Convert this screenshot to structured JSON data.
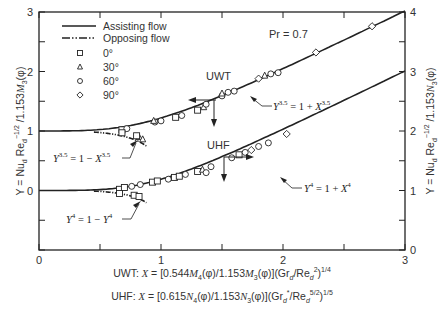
{
  "chart_data": {
    "type": "line",
    "title": "",
    "annotation_pr": "Pr = 0.7",
    "xlabel_lines": [
      "UWT: X = [0.544M4(φ)/1.153M3(φ)](Grd/Red²)^1/4",
      "UHF: X = [0.615N4(φ)/1.153N3(φ)](Gr*d/Red^5/2)^1/5"
    ],
    "ylabel_left": "Y = Nud Red^−1/2 / 1.153M3(φ)",
    "ylabel_right": "Y = Nud Red^−1/2 / 1.153N3(φ)",
    "xlim": [
      0,
      3
    ],
    "ylim_left": [
      -1,
      3
    ],
    "ylim_right": [
      0,
      4
    ],
    "x_ticks": [
      "0",
      "1",
      "2",
      "3"
    ],
    "y_ticks_left": [
      "0",
      "1",
      "2",
      "3"
    ],
    "y_ticks_right": [
      "0",
      "1",
      "2",
      "3",
      "4"
    ],
    "grid": false,
    "legend": {
      "position": "upper left",
      "lines": [
        {
          "label": "Assisting flow",
          "style": "solid"
        },
        {
          "label": "Opposing flow",
          "style": "dash-dot-dot"
        }
      ],
      "markers": [
        {
          "label": "0°",
          "marker": "square"
        },
        {
          "label": "30°",
          "marker": "triangle"
        },
        {
          "label": "60°",
          "marker": "circle"
        },
        {
          "label": "90°",
          "marker": "diamond"
        }
      ]
    },
    "series": [
      {
        "name": "UWT assisting",
        "axis": "left",
        "equation": "Y^3.5 = 1 + X^3.5",
        "n": 3.5,
        "sign": 1,
        "x_range": [
          0,
          3
        ]
      },
      {
        "name": "UWT opposing",
        "axis": "left",
        "equation": "Y^3.5 = 1 − X^3.5",
        "n": 3.5,
        "sign": -1,
        "x_range": [
          0.45,
          0.88
        ]
      },
      {
        "name": "UHF assisting",
        "axis": "right",
        "equation": "Y^4 = 1 + X^4",
        "n": 4,
        "sign": 1,
        "x_range": [
          0,
          3
        ]
      },
      {
        "name": "UHF opposing",
        "axis": "right",
        "equation": "Y^4 = 1 − Y^4",
        "n": 4,
        "sign": -1,
        "x_range": [
          0.45,
          0.88
        ]
      }
    ],
    "points": {
      "UWT": [
        {
          "m": "square",
          "x": 0.68,
          "y": 1.02
        },
        {
          "m": "circle",
          "x": 0.72,
          "y": 1.04
        },
        {
          "m": "square",
          "x": 0.68,
          "y": 0.97
        },
        {
          "m": "circle",
          "x": 0.95,
          "y": 1.15
        },
        {
          "m": "triangle",
          "x": 0.94,
          "y": 1.17
        },
        {
          "m": "circle",
          "x": 1.0,
          "y": 1.17
        },
        {
          "m": "square",
          "x": 1.12,
          "y": 1.23
        },
        {
          "m": "circle",
          "x": 1.17,
          "y": 1.26
        },
        {
          "m": "square",
          "x": 1.3,
          "y": 1.35
        },
        {
          "m": "triangle",
          "x": 1.35,
          "y": 1.4
        },
        {
          "m": "circle",
          "x": 1.37,
          "y": 1.45
        },
        {
          "m": "circle",
          "x": 1.5,
          "y": 1.59
        },
        {
          "m": "triangle",
          "x": 1.5,
          "y": 1.63
        },
        {
          "m": "circle",
          "x": 1.55,
          "y": 1.65
        },
        {
          "m": "circle",
          "x": 1.6,
          "y": 1.67
        },
        {
          "m": "diamond",
          "x": 1.8,
          "y": 1.88
        },
        {
          "m": "triangle",
          "x": 1.85,
          "y": 1.93
        },
        {
          "m": "circle",
          "x": 1.9,
          "y": 1.96
        },
        {
          "m": "circle",
          "x": 1.96,
          "y": 1.98
        },
        {
          "m": "diamond",
          "x": 2.27,
          "y": 2.32
        },
        {
          "m": "diamond",
          "x": 2.73,
          "y": 2.76
        },
        {
          "m": "triangle",
          "x": 0.82,
          "y": 0.9
        },
        {
          "m": "triangle",
          "x": 0.85,
          "y": 0.86
        },
        {
          "m": "square",
          "x": 0.8,
          "y": 0.92
        }
      ],
      "UHF": [
        {
          "m": "square",
          "x": 0.66,
          "y": 1.02
        },
        {
          "m": "square",
          "x": 0.7,
          "y": 1.05
        },
        {
          "m": "circle",
          "x": 0.76,
          "y": 1.07
        },
        {
          "m": "circle",
          "x": 0.83,
          "y": 1.1
        },
        {
          "m": "square",
          "x": 0.93,
          "y": 1.14
        },
        {
          "m": "square",
          "x": 0.97,
          "y": 1.16
        },
        {
          "m": "circle",
          "x": 1.06,
          "y": 1.19
        },
        {
          "m": "square",
          "x": 1.11,
          "y": 1.22
        },
        {
          "m": "square",
          "x": 1.15,
          "y": 1.24
        },
        {
          "m": "circle",
          "x": 1.2,
          "y": 1.27
        },
        {
          "m": "square",
          "x": 1.3,
          "y": 1.32
        },
        {
          "m": "triangle",
          "x": 1.34,
          "y": 1.35
        },
        {
          "m": "circle",
          "x": 1.37,
          "y": 1.3
        },
        {
          "m": "circle",
          "x": 1.41,
          "y": 1.4
        },
        {
          "m": "circle",
          "x": 1.58,
          "y": 1.55
        },
        {
          "m": "square",
          "x": 1.64,
          "y": 1.6
        },
        {
          "m": "circle",
          "x": 1.69,
          "y": 1.64
        },
        {
          "m": "diamond",
          "x": 1.74,
          "y": 1.68
        },
        {
          "m": "circle",
          "x": 1.8,
          "y": 1.74
        },
        {
          "m": "circle",
          "x": 1.88,
          "y": 1.8
        },
        {
          "m": "diamond",
          "x": 2.03,
          "y": 1.95
        },
        {
          "m": "square",
          "x": 0.66,
          "y": 0.95
        },
        {
          "m": "square",
          "x": 0.78,
          "y": 0.92
        },
        {
          "m": "square",
          "x": 0.82,
          "y": 0.9
        }
      ]
    },
    "curve_labels": {
      "uwt": "UWT",
      "uhf": "UHF",
      "uwt_assist": "Y^3.5 = 1 + X^3.5",
      "uwt_oppose": "Y^3.5 = 1 − X^3.5",
      "uhf_assist": "Y^4 = 1 + X^4",
      "uhf_oppose": "Y^4 = 1 − Y^4"
    }
  },
  "labels": {
    "pr": "Pr = 0.7",
    "uwt": "UWT",
    "uhf": "UHF",
    "legend_assisting": "Assisting flow",
    "legend_opposing": "Opposing flow",
    "legend_0": "0°",
    "legend_30": "30°",
    "legend_60": "60°",
    "legend_90": "90°",
    "caption_uwt_prefix": "UWT:",
    "caption_uhf_prefix": "UHF:"
  }
}
